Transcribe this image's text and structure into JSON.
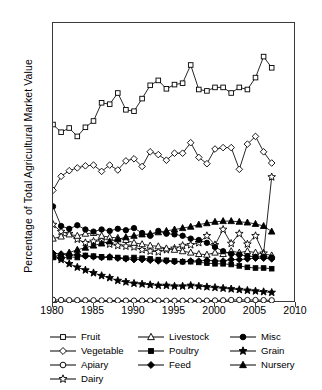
{
  "chart_data": {
    "type": "line",
    "title": "",
    "xlabel": "",
    "ylabel": "Percentage of Total Agricultural Market Value",
    "xlim": [
      1980,
      2010
    ],
    "ylim": [
      0,
      40
    ],
    "xticks": [
      1980,
      1985,
      1990,
      1995,
      2000,
      2005,
      2010
    ],
    "yticks": [
      0,
      5,
      10,
      15,
      20,
      25,
      30,
      35,
      40
    ],
    "grid": false,
    "legend_position": "below-plot",
    "x": [
      1980,
      1981,
      1982,
      1983,
      1984,
      1985,
      1986,
      1987,
      1988,
      1989,
      1990,
      1991,
      1992,
      1993,
      1994,
      1995,
      1996,
      1997,
      1998,
      1999,
      2000,
      2001,
      2002,
      2003,
      2004,
      2005,
      2006,
      2007
    ],
    "series": [
      {
        "name": "Fruit",
        "marker": "open-square",
        "values": [
          25.5,
          24.4,
          25.0,
          23.8,
          25.1,
          26.0,
          28.6,
          28.4,
          30.0,
          27.6,
          27.4,
          29.2,
          31.1,
          31.8,
          30.6,
          31.2,
          31.4,
          34.0,
          30.5,
          30.3,
          30.8,
          30.8,
          30.0,
          30.8,
          30.5,
          32.2,
          35.2,
          33.6
        ]
      },
      {
        "name": "Vegetable",
        "marker": "open-diamond",
        "values": [
          16.1,
          18.1,
          18.9,
          19.3,
          19.6,
          19.7,
          18.8,
          19.7,
          19.0,
          20.3,
          20.6,
          19.5,
          21.6,
          21.2,
          20.4,
          21.4,
          21.4,
          22.9,
          20.8,
          19.9,
          22.0,
          22.2,
          22.2,
          19.1,
          22.7,
          23.8,
          21.6,
          20.0
        ]
      },
      {
        "name": "Apiary",
        "marker": "open-circle",
        "values": [
          0.45,
          0.42,
          0.4,
          0.4,
          0.38,
          0.38,
          0.36,
          0.36,
          0.36,
          0.34,
          0.34,
          0.34,
          0.34,
          0.34,
          0.32,
          0.32,
          0.32,
          0.32,
          0.34,
          0.34,
          0.36,
          0.38,
          0.42,
          0.44,
          0.42,
          0.42,
          0.4,
          0.38
        ]
      },
      {
        "name": "Dairy",
        "marker": "open-star",
        "values": [
          11.2,
          10.2,
          9.9,
          9.1,
          8.6,
          8.8,
          8.9,
          8.4,
          8.2,
          8.1,
          8.0,
          7.6,
          7.4,
          7.3,
          7.6,
          7.8,
          8.2,
          8.3,
          8.6,
          9.6,
          8.3,
          10.5,
          8.5,
          9.9,
          8.4,
          9.6,
          7.1,
          18.0
        ]
      },
      {
        "name": "Livestock",
        "marker": "open-triangle",
        "values": [
          9.2,
          9.5,
          9.8,
          9.6,
          9.9,
          10.0,
          9.6,
          9.4,
          9.3,
          9.0,
          8.6,
          8.4,
          8.2,
          8.1,
          7.8,
          7.6,
          7.4,
          7.2,
          7.0,
          6.9,
          7.2,
          7.0,
          7.4,
          7.2,
          7.4,
          7.2,
          7.0,
          6.8
        ]
      },
      {
        "name": "Poultry",
        "marker": "filled-square",
        "values": [
          6.5,
          6.4,
          6.6,
          6.5,
          6.8,
          6.7,
          6.6,
          6.5,
          6.5,
          6.4,
          6.5,
          6.4,
          6.3,
          6.2,
          6.1,
          6.0,
          5.9,
          5.9,
          5.8,
          5.7,
          5.6,
          5.6,
          5.5,
          5.3,
          5.1,
          5.0,
          5.0,
          4.9
        ]
      },
      {
        "name": "Feed",
        "marker": "filled-diamond",
        "values": [
          7.1,
          7.0,
          6.8,
          6.9,
          6.7,
          6.6,
          6.5,
          6.6,
          6.4,
          6.3,
          6.2,
          6.2,
          6.1,
          6.0,
          6.0,
          5.9,
          5.9,
          6.0,
          6.0,
          6.1,
          6.0,
          6.0,
          6.2,
          6.2,
          6.3,
          6.4,
          6.4,
          6.3
        ]
      },
      {
        "name": "Misc",
        "marker": "filled-circle",
        "values": [
          13.8,
          11.0,
          10.6,
          11.1,
          10.5,
          10.2,
          10.5,
          10.3,
          10.6,
          10.4,
          10.7,
          10.0,
          9.6,
          10.3,
          9.9,
          9.8,
          9.6,
          9.2,
          9.0,
          8.6,
          8.0,
          7.4,
          7.0,
          6.9,
          6.7,
          6.6,
          6.6,
          6.5
        ]
      },
      {
        "name": "Grain",
        "marker": "filled-star",
        "values": [
          6.9,
          6.2,
          5.6,
          5.1,
          4.7,
          4.3,
          3.9,
          3.6,
          3.2,
          3.0,
          2.8,
          2.7,
          2.6,
          2.5,
          2.5,
          2.4,
          2.4,
          2.5,
          2.4,
          2.3,
          2.2,
          2.1,
          2.0,
          1.9,
          1.8,
          1.7,
          1.6,
          1.5
        ]
      },
      {
        "name": "Nursery",
        "marker": "filled-triangle",
        "values": [
          6.6,
          6.9,
          7.2,
          7.6,
          7.9,
          8.2,
          8.5,
          8.8,
          9.1,
          9.4,
          9.6,
          9.8,
          9.9,
          10.1,
          10.3,
          10.5,
          10.7,
          10.9,
          11.2,
          11.4,
          11.6,
          11.7,
          11.7,
          11.6,
          11.5,
          11.3,
          11.0,
          10.2
        ]
      }
    ]
  },
  "legend": {
    "columns": [
      [
        {
          "label": "Fruit",
          "marker": "open-square"
        },
        {
          "label": "Vegetable",
          "marker": "open-diamond"
        },
        {
          "label": "Apiary",
          "marker": "open-circle"
        },
        {
          "label": "Dairy",
          "marker": "open-star"
        }
      ],
      [
        {
          "label": "Livestock",
          "marker": "open-triangle"
        },
        {
          "label": "Poultry",
          "marker": "filled-square"
        },
        {
          "label": "Feed",
          "marker": "filled-diamond"
        }
      ],
      [
        {
          "label": "Misc",
          "marker": "filled-circle"
        },
        {
          "label": "Grain",
          "marker": "filled-star"
        },
        {
          "label": "Nursery",
          "marker": "filled-triangle"
        }
      ]
    ]
  }
}
